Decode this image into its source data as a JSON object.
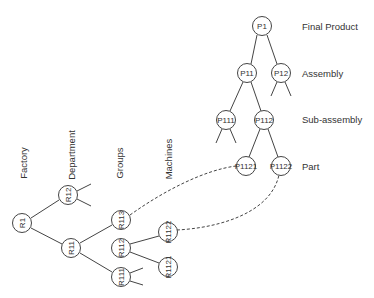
{
  "product_tree": {
    "level_labels": [
      {
        "text": "Final Product",
        "x": 302,
        "y": 26
      },
      {
        "text": "Assembly",
        "x": 302,
        "y": 73
      },
      {
        "text": "Sub-assembly",
        "x": 302,
        "y": 119
      },
      {
        "text": "Part",
        "x": 302,
        "y": 166
      }
    ],
    "nodes": [
      {
        "id": "P1",
        "label": "P1",
        "x": 262,
        "y": 26
      },
      {
        "id": "P11",
        "label": "P11",
        "x": 247,
        "y": 73
      },
      {
        "id": "P12",
        "label": "P12",
        "x": 281,
        "y": 73
      },
      {
        "id": "P111",
        "label": "P111",
        "x": 226,
        "y": 120
      },
      {
        "id": "P112",
        "label": "P112",
        "x": 264,
        "y": 120
      },
      {
        "id": "P1121",
        "label": "P1121",
        "x": 246,
        "y": 166
      },
      {
        "id": "P1122",
        "label": "P1122",
        "x": 281,
        "y": 166
      }
    ]
  },
  "resource_tree": {
    "level_labels": [
      {
        "text": "Factory",
        "x": 23,
        "y": 163
      },
      {
        "text": "Department",
        "x": 71,
        "y": 155
      },
      {
        "text": "Groups",
        "x": 119,
        "y": 163
      },
      {
        "text": "Machines",
        "x": 168,
        "y": 159
      }
    ],
    "nodes": [
      {
        "id": "R1",
        "label": "R1",
        "x": 22,
        "y": 223
      },
      {
        "id": "R12",
        "label": "R12",
        "x": 68,
        "y": 195
      },
      {
        "id": "R11",
        "label": "R11",
        "x": 71,
        "y": 248
      },
      {
        "id": "R113",
        "label": "R113",
        "x": 121,
        "y": 220
      },
      {
        "id": "R112",
        "label": "R112",
        "x": 121,
        "y": 248
      },
      {
        "id": "R111",
        "label": "R111",
        "x": 121,
        "y": 277
      },
      {
        "id": "R1122",
        "label": "R1122",
        "x": 168,
        "y": 232
      },
      {
        "id": "R1121",
        "label": "R1121",
        "x": 168,
        "y": 267
      }
    ]
  },
  "mappings": [
    {
      "from": "R113",
      "to": "P1121"
    },
    {
      "from": "R1122",
      "to": "P1122"
    }
  ]
}
